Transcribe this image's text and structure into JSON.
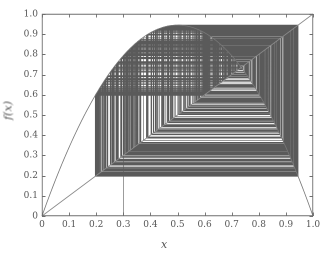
{
  "figure": {
    "width": 328,
    "height": 257,
    "background": "#ffffff",
    "axes_color": "#6e6e6e",
    "curve_color": "#777777",
    "cobweb_color": "#5a5a5a",
    "diagonal_color": "#8a8a8a",
    "tick_label_color": "#555555"
  },
  "chart_data": {
    "type": "line",
    "title": "",
    "subtitle": "",
    "xlabel": "x",
    "ylabel": "f(x)",
    "xlim": [
      0.0,
      1.0
    ],
    "ylim": [
      0.0,
      1.0
    ],
    "grid": false,
    "legend": null,
    "xticks": [
      0.0,
      0.1,
      0.2,
      0.3,
      0.4,
      0.5,
      0.6,
      0.7,
      0.8,
      0.9,
      1.0
    ],
    "xticklabels": [
      "0",
      "0.1",
      "0.2",
      "0.3",
      "0.4",
      "0.5",
      "0.6",
      "0.7",
      "0.8",
      "0.9",
      "1.0"
    ],
    "yticks": [
      0.0,
      0.1,
      0.2,
      0.3,
      0.4,
      0.5,
      0.6,
      0.7,
      0.8,
      0.9,
      1.0
    ],
    "yticklabels": [
      "0",
      "0.1",
      "0.2",
      "0.3",
      "0.4",
      "0.5",
      "0.6",
      "0.7",
      "0.8",
      "0.9",
      "1.0"
    ],
    "tick_direction": "in",
    "series": [
      {
        "name": "f(x) = r x (1 - x)",
        "kind": "map-curve",
        "r": 3.78,
        "color": "#777777",
        "peak": {
          "x": 0.5,
          "y": 0.945
        },
        "endpoints": [
          {
            "x": 0.0,
            "y": 0.0
          },
          {
            "x": 1.0,
            "y": 0.0
          }
        ]
      },
      {
        "name": "y = x",
        "kind": "diagonal",
        "color": "#8a8a8a",
        "endpoints": [
          {
            "x": 0.0,
            "y": 0.0
          },
          {
            "x": 1.0,
            "y": 1.0
          }
        ]
      },
      {
        "name": "cobweb iteration",
        "kind": "cobweb",
        "color": "#5a5a5a",
        "x0": 0.3,
        "iterations": 600,
        "fixed_point": {
          "x": 0.7354,
          "y": 0.7354
        }
      }
    ],
    "annotations": [
      {
        "text": "initial vertical segment at x0",
        "x": 0.3,
        "y": 0.0
      }
    ]
  }
}
